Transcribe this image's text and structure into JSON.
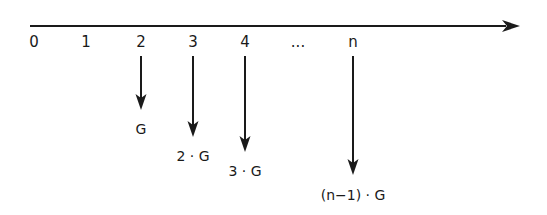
{
  "axis": {
    "x_start": 30,
    "x_end": 520,
    "y": 26,
    "color": "#1a1a1a",
    "ticks": [
      {
        "label": "0",
        "x": 34
      },
      {
        "label": "1",
        "x": 86
      },
      {
        "label": "2",
        "x": 141
      },
      {
        "label": "3",
        "x": 193
      },
      {
        "label": "4",
        "x": 245
      },
      {
        "label": "...",
        "x": 298
      },
      {
        "label": "n",
        "x": 353
      }
    ]
  },
  "payments": [
    {
      "period": "2",
      "x": 141,
      "tip_y": 110,
      "label": "G",
      "label_y": 129
    },
    {
      "period": "3",
      "x": 193,
      "tip_y": 137,
      "label": "2 · G",
      "label_y": 156
    },
    {
      "period": "4",
      "x": 245,
      "tip_y": 152,
      "label": "3 · G",
      "label_y": 171
    },
    {
      "period": "n",
      "x": 353,
      "tip_y": 175,
      "label": "(n−1) · G",
      "label_y": 195
    }
  ],
  "arrow_start_y": 56
}
